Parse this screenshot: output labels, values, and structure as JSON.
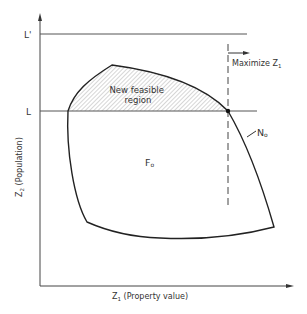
{
  "diagram": {
    "axes": {
      "x_label_main": "Z",
      "x_label_sub": "1",
      "x_label_rest": " (Property value)",
      "y_label_main": "Z",
      "y_label_sub": "2",
      "y_label_rest": " (Population)"
    },
    "levels": {
      "upper": "L'",
      "lower": "L"
    },
    "regions": {
      "shaded": "New feasible",
      "shaded_line2": "region",
      "original_main": "F",
      "original_sub": "o"
    },
    "curve": {
      "label_main": "N",
      "label_sub": "o"
    },
    "annotation": {
      "direction_main": "Maximize  Z",
      "direction_sub": "1"
    },
    "colors": {
      "line": "#333333",
      "hatch": "#9a9a9a",
      "background": "#ffffff"
    }
  }
}
